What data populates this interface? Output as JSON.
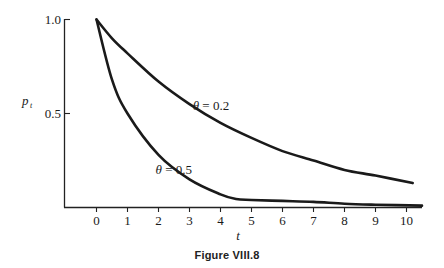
{
  "figure": {
    "caption": "Figure VIII.8"
  },
  "chart_data": {
    "type": "line",
    "title": "",
    "xlabel": "t",
    "ylabel": "p_t",
    "xlim": [
      -1,
      10.5
    ],
    "ylim": [
      0,
      1.0
    ],
    "xticks": [
      0,
      1,
      2,
      3,
      4,
      5,
      6,
      7,
      8,
      9,
      10
    ],
    "xtick_labels": [
      "0",
      "1",
      "2",
      "3",
      "4",
      "5",
      "6",
      "7",
      "8",
      "9",
      "10"
    ],
    "yticks": [
      0.5,
      1.0
    ],
    "ytick_labels": [
      "0.5",
      "1.0"
    ],
    "grid": false,
    "legend": "inline annotations",
    "series": [
      {
        "name": "θ = 0.2",
        "label": "θ = 0.2",
        "x": [
          0,
          0.5,
          1,
          2,
          3,
          4,
          5,
          6,
          7,
          8,
          9,
          10
        ],
        "values": [
          1.0,
          0.9,
          0.82,
          0.67,
          0.55,
          0.45,
          0.37,
          0.3,
          0.25,
          0.2,
          0.17,
          0.13
        ]
      },
      {
        "name": "θ = 0.5",
        "label": "θ = 0.5",
        "x": [
          0,
          0.5,
          1,
          2,
          3,
          4,
          4.5,
          5,
          6,
          7,
          8,
          9,
          10
        ],
        "values": [
          1.0,
          0.68,
          0.5,
          0.28,
          0.15,
          0.07,
          0.045,
          0.04,
          0.035,
          0.03,
          0.02,
          0.015,
          0.01
        ]
      }
    ],
    "annotations": [
      {
        "text": "θ = 0.2",
        "x": 4.2,
        "y": 0.54
      },
      {
        "text": "θ = 0.5",
        "x": 3.0,
        "y": 0.2
      }
    ]
  }
}
